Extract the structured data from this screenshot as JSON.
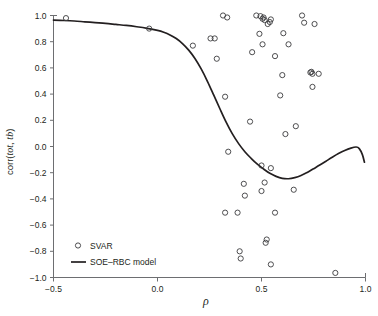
{
  "chart_data": {
    "type": "scatter",
    "title": "",
    "xlabel": "ρ",
    "ylabel": "corr(tot, tb)",
    "xlim": [
      -0.5,
      1.0
    ],
    "ylim": [
      -1.0,
      1.0
    ],
    "grid": false,
    "xticks": [
      -0.5,
      0.0,
      0.5,
      1.0
    ],
    "xtick_labels": [
      "−0.5",
      "0.0",
      "0.5",
      "1.0"
    ],
    "yticks": [
      -1.0,
      -0.8,
      -0.6,
      -0.4,
      -0.2,
      0.0,
      0.2,
      0.4,
      0.6,
      0.8,
      1.0
    ],
    "ytick_labels": [
      "−1.0",
      "−0.8",
      "−0.6",
      "−0.4",
      "−0.2",
      "0.0",
      "0.2",
      "0.4",
      "0.6",
      "0.8",
      "1.0"
    ],
    "legend_position": "lower-left",
    "legend": [
      {
        "name": "SVAR",
        "marker": "open-circle"
      },
      {
        "name": "SOE–RBC model",
        "marker": "line"
      }
    ],
    "series": [
      {
        "name": "SVAR",
        "type": "scatter",
        "marker": "open-circle",
        "color": "#3b3b3d",
        "points": [
          [
            -0.44,
            0.98
          ],
          [
            -0.04,
            0.9
          ],
          [
            0.17,
            0.77
          ],
          [
            0.255,
            0.825
          ],
          [
            0.275,
            0.825
          ],
          [
            0.285,
            0.67
          ],
          [
            0.315,
            1.0
          ],
          [
            0.335,
            0.985
          ],
          [
            0.325,
            0.38
          ],
          [
            0.34,
            -0.04
          ],
          [
            0.325,
            -0.505
          ],
          [
            0.385,
            -0.505
          ],
          [
            0.395,
            -0.8
          ],
          [
            0.4,
            -0.855
          ],
          [
            0.415,
            -0.285
          ],
          [
            0.42,
            -0.375
          ],
          [
            0.445,
            0.19
          ],
          [
            0.455,
            0.72
          ],
          [
            0.475,
            1.0
          ],
          [
            0.49,
            0.86
          ],
          [
            0.495,
            0.995
          ],
          [
            0.505,
            0.975
          ],
          [
            0.51,
            0.985
          ],
          [
            0.515,
            0.965
          ],
          [
            0.505,
            0.78
          ],
          [
            0.5,
            -0.145
          ],
          [
            0.5,
            -0.34
          ],
          [
            0.515,
            -0.275
          ],
          [
            0.52,
            -0.735
          ],
          [
            0.525,
            -0.71
          ],
          [
            0.53,
            0.935
          ],
          [
            0.54,
            0.95
          ],
          [
            0.545,
            0.97
          ],
          [
            0.545,
            -0.165
          ],
          [
            0.545,
            -0.9
          ],
          [
            0.565,
            0.69
          ],
          [
            0.565,
            -0.505
          ],
          [
            0.59,
            0.39
          ],
          [
            0.6,
            0.545
          ],
          [
            0.605,
            0.865
          ],
          [
            0.615,
            0.095
          ],
          [
            0.63,
            0.78
          ],
          [
            0.655,
            -0.33
          ],
          [
            0.665,
            0.155
          ],
          [
            0.695,
            1.0
          ],
          [
            0.705,
            0.945
          ],
          [
            0.735,
            0.565
          ],
          [
            0.745,
            0.555
          ],
          [
            0.74,
            0.57
          ],
          [
            0.745,
            0.455
          ],
          [
            0.755,
            0.935
          ],
          [
            0.775,
            0.555
          ],
          [
            0.855,
            -0.965
          ]
        ]
      },
      {
        "name": "SOE–RBC model",
        "type": "line",
        "color": "#231f20",
        "points": [
          [
            -0.5,
            0.965
          ],
          [
            -0.45,
            0.962
          ],
          [
            -0.4,
            0.958
          ],
          [
            -0.35,
            0.952
          ],
          [
            -0.3,
            0.946
          ],
          [
            -0.25,
            0.94
          ],
          [
            -0.2,
            0.932
          ],
          [
            -0.15,
            0.924
          ],
          [
            -0.1,
            0.914
          ],
          [
            -0.05,
            0.902
          ],
          [
            0.0,
            0.886
          ],
          [
            0.03,
            0.872
          ],
          [
            0.06,
            0.852
          ],
          [
            0.09,
            0.824
          ],
          [
            0.12,
            0.786
          ],
          [
            0.15,
            0.736
          ],
          [
            0.18,
            0.672
          ],
          [
            0.21,
            0.592
          ],
          [
            0.24,
            0.498
          ],
          [
            0.27,
            0.394
          ],
          [
            0.3,
            0.288
          ],
          [
            0.33,
            0.186
          ],
          [
            0.36,
            0.096
          ],
          [
            0.39,
            0.022
          ],
          [
            0.42,
            -0.04
          ],
          [
            0.45,
            -0.09
          ],
          [
            0.48,
            -0.135
          ],
          [
            0.51,
            -0.172
          ],
          [
            0.54,
            -0.205
          ],
          [
            0.57,
            -0.228
          ],
          [
            0.6,
            -0.243
          ],
          [
            0.63,
            -0.246
          ],
          [
            0.66,
            -0.238
          ],
          [
            0.69,
            -0.222
          ],
          [
            0.72,
            -0.198
          ],
          [
            0.75,
            -0.17
          ],
          [
            0.78,
            -0.142
          ],
          [
            0.81,
            -0.112
          ],
          [
            0.84,
            -0.082
          ],
          [
            0.87,
            -0.054
          ],
          [
            0.9,
            -0.03
          ],
          [
            0.93,
            -0.012
          ],
          [
            0.955,
            -0.004
          ],
          [
            0.97,
            -0.016
          ],
          [
            0.985,
            -0.062
          ],
          [
            0.995,
            -0.12
          ]
        ]
      }
    ]
  },
  "axes": {
    "ylabel_prefix": "corr(",
    "ylabel_italic_1": "tot",
    "ylabel_sep": ", ",
    "ylabel_italic_2": "tb",
    "ylabel_suffix": ")"
  }
}
